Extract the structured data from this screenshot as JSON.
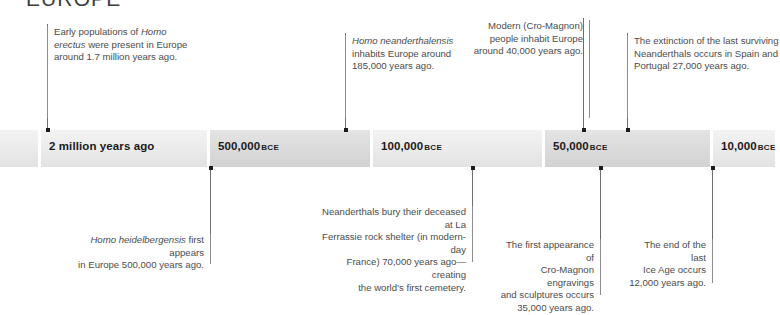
{
  "header": {
    "region_title": "EUROPE"
  },
  "timeline": {
    "segments": [
      {
        "label": "",
        "era": "",
        "shade": "light"
      },
      {
        "label": "2 million years ago",
        "era": "",
        "shade": "light"
      },
      {
        "label": "500,000",
        "era": "BCE",
        "shade": "dark"
      },
      {
        "label": "100,000",
        "era": "BCE",
        "shade": "light"
      },
      {
        "label": "50,000",
        "era": "BCE",
        "shade": "dark"
      },
      {
        "label": "10,000",
        "era": "BCE",
        "shade": "light"
      }
    ]
  },
  "callouts_above": [
    {
      "id": "homo-erectus-europe",
      "line1": "Early populations of ",
      "em1": "Homo",
      "line2": "erectus",
      "line2_rest": " were present in Europe",
      "line3": "around 1.7 million years ago."
    },
    {
      "id": "homo-neanderthalensis",
      "em1": "Homo neanderthalensis",
      "line2": "inhabits Europe around",
      "line3": "185,000 years ago."
    },
    {
      "id": "cro-magnon-arrival",
      "line1": "Modern (Cro-Magnon)",
      "line2": "people inhabit Europe",
      "line3": "around 40,000 years ago."
    },
    {
      "id": "neanderthal-extinction",
      "line1": "The extinction of the last surviving",
      "line2": "Neanderthals occurs in Spain and",
      "line3": "Portugal 27,000 years ago."
    }
  ],
  "callouts_below": [
    {
      "id": "homo-heidelbergensis",
      "em1": "Homo heidelbergensis",
      "line1_rest": " first appears",
      "line2": "in Europe 500,000 years ago."
    },
    {
      "id": "la-ferrassie-burial",
      "line1": "Neanderthals bury their deceased at La",
      "line2": "Ferrassie rock shelter (in modern-day",
      "line3": "France) 70,000 years ago—creating",
      "line4": "the world’s first cemetery."
    },
    {
      "id": "cro-magnon-art",
      "line1": "The first appearance of",
      "line2": "Cro-Magnon engravings",
      "line3": "and sculptures occurs",
      "line4": "35,000 years ago."
    },
    {
      "id": "ice-age-end",
      "line1": "The end of the last",
      "line2": "Ice Age occurs",
      "line3": "12,000 years ago."
    }
  ]
}
